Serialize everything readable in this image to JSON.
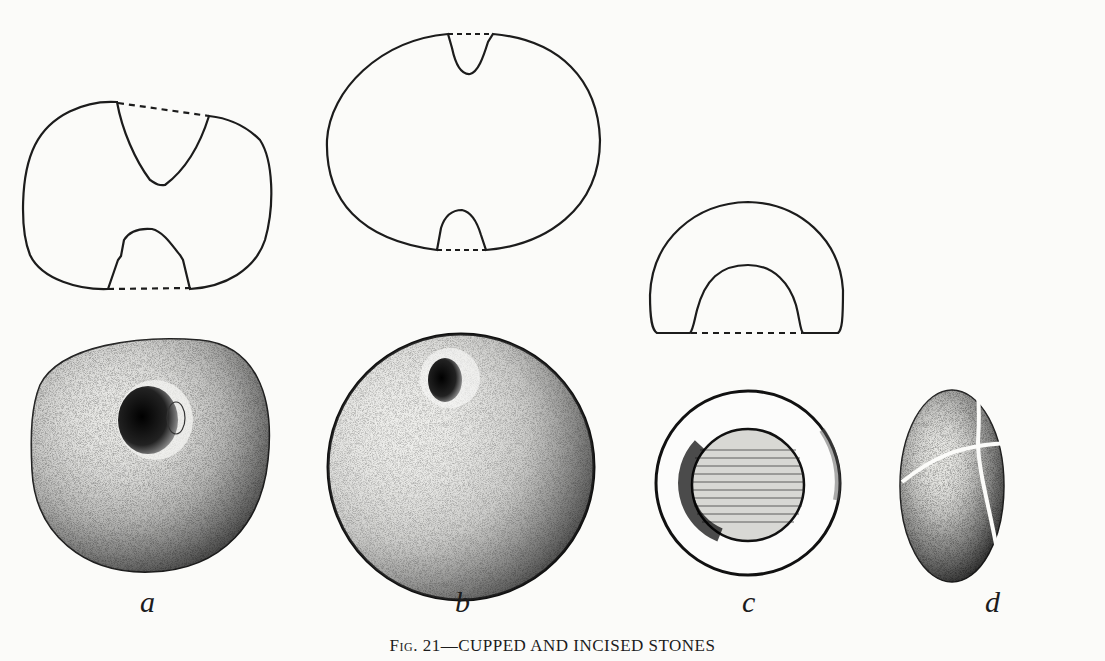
{
  "figure": {
    "number_prefix": "Fig. 21",
    "title": "—CUPPED AND INCISED STONES",
    "items": [
      {
        "label": "a",
        "description": "cupped stone with biconical perforation (section and view)"
      },
      {
        "label": "b",
        "description": "spherical stone with shallow cups (section and view)"
      },
      {
        "label": "c",
        "description": "stone with single deep cup (section and view)"
      },
      {
        "label": "d",
        "description": "spherical stone with cross incisions"
      }
    ]
  }
}
